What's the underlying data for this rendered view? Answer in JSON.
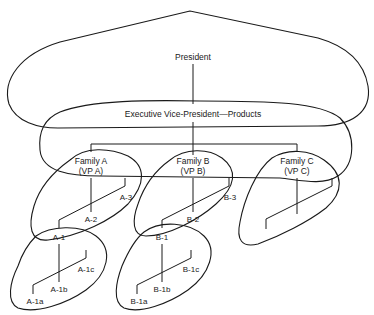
{
  "diagram": {
    "type": "organization-chart-with-overlapping-groups",
    "nodes": {
      "president": "President",
      "evp": "Executive Vice-President—Products",
      "family_a": {
        "line1": "Family A",
        "line2": "(VP A)"
      },
      "family_b": {
        "line1": "Family B",
        "line2": "(VP B)"
      },
      "family_c": {
        "line1": "Family C",
        "line2": "(VP C)"
      },
      "a1": "A-1",
      "a2": "A-2",
      "a3": "A-3",
      "a1a": "A-1a",
      "a1b": "A-1b",
      "a1c": "A-1c",
      "b1": "B-1",
      "b2": "B-2",
      "b3": "B-3",
      "b1a": "B-1a",
      "b1b": "B-1b",
      "b1c": "B-1c"
    },
    "edges": [
      [
        "President",
        "Executive Vice-President—Products"
      ],
      [
        "Executive Vice-President—Products",
        "Family A (VP A)"
      ],
      [
        "Executive Vice-President—Products",
        "Family B (VP B)"
      ],
      [
        "Executive Vice-President—Products",
        "Family C (VP C)"
      ],
      [
        "Family A (VP A)",
        "A-1"
      ],
      [
        "Family A (VP A)",
        "A-2"
      ],
      [
        "Family A (VP A)",
        "A-3"
      ],
      [
        "A-1",
        "A-1a"
      ],
      [
        "A-1",
        "A-1b"
      ],
      [
        "A-1",
        "A-1c"
      ],
      [
        "Family B (VP B)",
        "B-1"
      ],
      [
        "Family B (VP B)",
        "B-2"
      ],
      [
        "Family B (VP B)",
        "B-3"
      ],
      [
        "B-1",
        "B-1a"
      ],
      [
        "B-1",
        "B-1b"
      ],
      [
        "B-1",
        "B-1c"
      ],
      [
        "Family C (VP C)",
        "unlabeled-1"
      ],
      [
        "Family C (VP C)",
        "unlabeled-2"
      ],
      [
        "Family C (VP C)",
        "unlabeled-3"
      ]
    ],
    "groups": [
      "President + EVP",
      "EVP + Families A, B, C",
      "Family A + A-1, A-2, A-3",
      "A-1 + A-1a, A-1b, A-1c",
      "Family B + B-1, B-2, B-3",
      "B-1 + B-1a, B-1b, B-1c",
      "Family C + subordinates"
    ]
  }
}
